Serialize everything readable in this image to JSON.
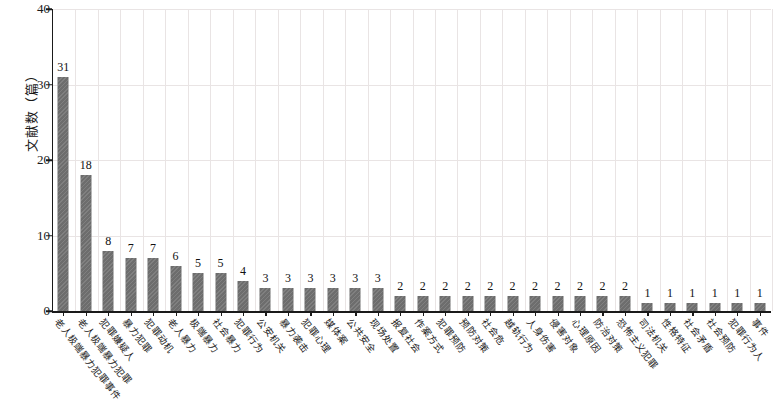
{
  "chart_data": {
    "type": "bar",
    "title": "",
    "subtitle": "",
    "xlabel": "",
    "ylabel": "文献数（篇）",
    "ylim": [
      0,
      40
    ],
    "yticks": [
      0,
      10,
      20,
      30,
      40
    ],
    "grid": true,
    "legend": null,
    "bar_color": "#6d6d6d",
    "categories": [
      "老人极端暴力犯罪事件",
      "老人极端暴力犯罪",
      "犯罪嫌疑人",
      "暴力犯罪",
      "犯罪动机",
      "老人暴力",
      "极端暴力",
      "社会暴力",
      "犯罪行为",
      "公安机关",
      "暴力袭击",
      "犯罪心理",
      "媒体案",
      "公共安全",
      "现场处置",
      "报复社会",
      "作案方式",
      "犯罪预防",
      "预防对策",
      "社会危",
      "越轨行为",
      "人身伤害",
      "侵害对象",
      "心理原因",
      "防治对策",
      "恐怖主义犯罪",
      "司法机关",
      "性格特征",
      "社会矛盾",
      "社会预防",
      "犯罪行为人",
      "事件"
    ],
    "values": [
      31,
      18,
      8,
      7,
      7,
      6,
      5,
      5,
      4,
      3,
      3,
      3,
      3,
      3,
      3,
      2,
      2,
      2,
      2,
      2,
      2,
      2,
      2,
      2,
      2,
      2,
      1,
      1,
      1,
      1,
      1,
      1
    ]
  }
}
